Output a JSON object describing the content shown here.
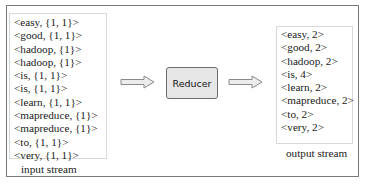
{
  "input": {
    "caption": "input stream",
    "items": [
      "<easy, {1, 1}>",
      "<good, {1, 1}>",
      "<hadoop, {1}>",
      "<hadoop, {1}>",
      "<is, {1, 1}>",
      "<is, {1, 1}>",
      "<learn, {1, 1}>",
      "<mapreduce, {1}>",
      "<mapreduce, {1}>",
      "<to, {1, 1}>",
      "<very, {1, 1}>"
    ]
  },
  "reducer": {
    "label": "Reducer"
  },
  "output": {
    "caption": "output stream",
    "items": [
      "<easy, 2>",
      "<good, 2>",
      "<hadoop, 2>",
      "<is, 4>",
      "<learn, 2>",
      "<mapreduce, 2>",
      "<to, 2>",
      "<very, 2>"
    ]
  },
  "colors": {
    "border": "#7a7a7a",
    "reducer_fill": "#e6e6e6",
    "arrow_fill": "#ececec"
  }
}
